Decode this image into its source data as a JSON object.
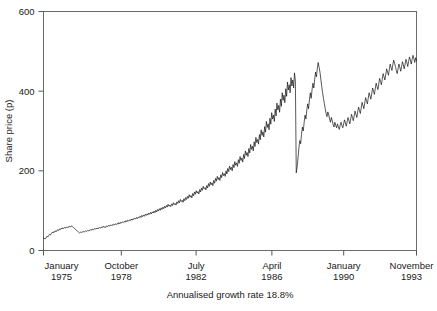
{
  "chart_data": {
    "type": "line",
    "title": "",
    "subtitle": "Annualised growth rate 18.8%",
    "xlabel": "",
    "ylabel": "Share price (p)",
    "ylim": [
      0,
      600
    ],
    "yticks": [
      0,
      200,
      400,
      600
    ],
    "ytick_labels": [
      "0",
      "200",
      "400",
      "600"
    ],
    "grid": false,
    "legend": "none",
    "xtick_labels": [
      {
        "month": "January",
        "year": "1975"
      },
      {
        "month": "October",
        "year": "1978"
      },
      {
        "month": "July",
        "year": "1982"
      },
      {
        "month": "April",
        "year": "1986"
      },
      {
        "month": "January",
        "year": "1990"
      },
      {
        "month": "November",
        "year": "1993"
      }
    ],
    "xtick_positions": [
      0,
      0.2086,
      0.4091,
      0.6123,
      0.8048,
      1.0
    ],
    "series": [
      {
        "name": "Share price",
        "color": "#111111",
        "values": [
          31,
          30,
          29,
          32,
          36,
          34,
          38,
          41,
          39,
          43,
          46,
          44,
          48,
          46,
          50,
          48,
          52,
          50,
          54,
          52,
          56,
          54,
          57,
          55,
          58,
          56,
          59,
          57,
          60,
          58,
          61,
          59,
          62,
          60,
          58,
          56,
          54,
          52,
          50,
          48,
          46,
          44,
          46,
          45,
          47,
          46,
          48,
          47,
          49,
          48,
          50,
          49,
          51,
          50,
          53,
          51,
          54,
          52,
          55,
          53,
          56,
          54,
          57,
          55,
          58,
          56,
          59,
          57,
          61,
          58,
          60,
          58,
          62,
          60,
          63,
          61,
          64,
          62,
          65,
          63,
          66,
          64,
          67,
          65,
          68,
          66,
          70,
          67,
          71,
          69,
          72,
          70,
          73,
          71,
          75,
          72,
          76,
          74,
          77,
          75,
          79,
          76,
          80,
          78,
          81,
          79,
          83,
          80,
          84,
          82,
          86,
          83,
          88,
          85,
          89,
          86,
          91,
          88,
          92,
          89,
          94,
          91,
          96,
          92,
          97,
          94,
          99,
          95,
          101,
          97,
          103,
          99,
          105,
          101,
          107,
          103,
          109,
          105,
          111,
          107,
          113,
          109,
          116,
          111,
          114,
          110,
          117,
          113,
          120,
          115,
          118,
          114,
          122,
          118,
          125,
          120,
          128,
          123,
          126,
          121,
          130,
          125,
          133,
          128,
          136,
          131,
          140,
          134,
          138,
          132,
          143,
          137,
          147,
          141,
          150,
          144,
          148,
          142,
          153,
          147,
          157,
          151,
          161,
          155,
          158,
          152,
          163,
          157,
          168,
          161,
          172,
          165,
          170,
          163,
          176,
          169,
          181,
          174,
          186,
          178,
          183,
          176,
          190,
          183,
          196,
          188,
          193,
          186,
          200,
          192,
          206,
          198,
          212,
          203,
          209,
          200,
          216,
          208,
          223,
          214,
          220,
          211,
          228,
          219,
          236,
          226,
          232,
          222,
          241,
          231,
          250,
          239,
          246,
          236,
          256,
          245,
          266,
          254,
          262,
          250,
          273,
          261,
          284,
          271,
          279,
          267,
          291,
          278,
          303,
          289,
          298,
          285,
          311,
          297,
          324,
          309,
          318,
          303,
          332,
          317,
          346,
          330,
          340,
          324,
          355,
          338,
          370,
          353,
          364,
          347,
          380,
          362,
          396,
          377,
          390,
          371,
          406,
          387,
          423,
          403,
          416,
          396,
          434,
          413,
          428,
          408,
          446,
          425,
          195,
          210,
          232,
          258,
          276,
          268,
          292,
          310,
          300,
          322,
          340,
          330,
          352,
          368,
          356,
          378,
          396,
          382,
          404,
          420,
          408,
          430,
          448,
          436,
          458,
          472,
          460,
          448,
          430,
          412,
          396,
          382,
          368,
          356,
          344,
          336,
          348,
          340,
          330,
          322,
          334,
          326,
          316,
          310,
          322,
          314,
          308,
          318,
          310,
          304,
          314,
          322,
          314,
          308,
          318,
          328,
          320,
          312,
          324,
          334,
          326,
          318,
          330,
          342,
          334,
          326,
          338,
          350,
          342,
          334,
          348,
          360,
          352,
          344,
          358,
          372,
          364,
          356,
          370,
          384,
          376,
          368,
          382,
          396,
          388,
          380,
          394,
          408,
          400,
          392,
          406,
          420,
          412,
          404,
          418,
          432,
          424,
          416,
          430,
          444,
          436,
          428,
          442,
          456,
          448,
          440,
          454,
          468,
          460,
          452,
          466,
          478,
          470,
          462,
          452,
          444,
          456,
          468,
          460,
          450,
          462,
          474,
          466,
          456,
          468,
          480,
          472,
          462,
          474,
          486,
          478,
          468,
          480,
          490,
          482,
          472,
          484,
          476
        ]
      }
    ]
  }
}
